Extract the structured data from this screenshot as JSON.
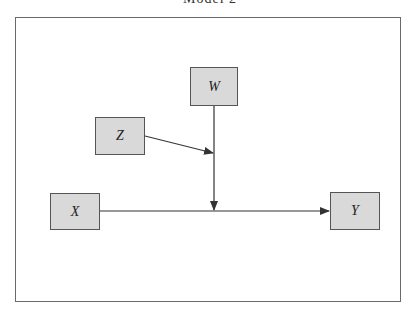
{
  "diagram": {
    "title_partial": "Model 2",
    "nodes": [
      {
        "id": "W",
        "label": "W",
        "x": 190,
        "y": 67,
        "w": 48,
        "h": 39
      },
      {
        "id": "Z",
        "label": "Z",
        "x": 95,
        "y": 117,
        "w": 50,
        "h": 38
      },
      {
        "id": "X",
        "label": "X",
        "x": 50,
        "y": 193,
        "w": 50,
        "h": 37
      },
      {
        "id": "Y",
        "label": "Y",
        "x": 330,
        "y": 192,
        "w": 50,
        "h": 38
      }
    ],
    "edges": [
      {
        "from": "X",
        "to": "Y"
      },
      {
        "from": "W",
        "to": "X-Y path"
      },
      {
        "from": "Z",
        "to": "W-path"
      }
    ],
    "colors": {
      "node_fill": "#d9d9d9",
      "stroke": "#333333",
      "frame": "#6a6a6a"
    }
  }
}
